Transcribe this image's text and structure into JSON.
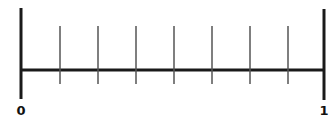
{
  "number_line": {
    "start_label": "0",
    "end_label": "1",
    "divisions": 8,
    "tick_count": 7,
    "line_color": "#1a1a1a",
    "tick_color": "#555555"
  }
}
